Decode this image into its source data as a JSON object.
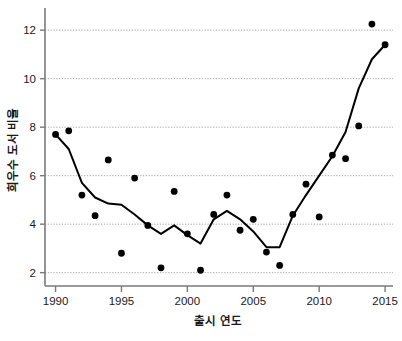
{
  "chart_data": {
    "type": "scatter",
    "title": "",
    "subtitle": "",
    "xlabel": "출시 연도",
    "ylabel": "희우수 도서 비율",
    "xlim": [
      1989.2,
      2015.6
    ],
    "ylim": [
      1.45,
      12.75
    ],
    "xticks": [
      1990,
      1995,
      2000,
      2005,
      2010,
      2015
    ],
    "xtick_labels": [
      "1990",
      "1995",
      "2000",
      "2005",
      "2010",
      "2015"
    ],
    "yticks": [
      2,
      4,
      6,
      8,
      10,
      12
    ],
    "ytick_labels": [
      "2",
      "4",
      "6",
      "8",
      "10",
      "12"
    ],
    "grid": "horizontal-dotted",
    "grid_color": "#8a8a8a",
    "legend": "none",
    "marker_color": "#000000",
    "line_color": "#000000",
    "axis_color": "#7a7a7a",
    "x": [
      1990,
      1991,
      1992,
      1993,
      1994,
      1995,
      1996,
      1997,
      1998,
      1999,
      2000,
      2001,
      2002,
      2003,
      2004,
      2005,
      2006,
      2007,
      2008,
      2009,
      2010,
      2011,
      2012,
      2013,
      2014,
      2015
    ],
    "series": [
      {
        "name": "scatter-points",
        "render": "markers",
        "values": [
          7.7,
          7.85,
          5.2,
          4.35,
          6.65,
          2.8,
          5.9,
          3.95,
          2.2,
          5.35,
          3.6,
          2.1,
          4.4,
          5.2,
          3.75,
          4.2,
          2.85,
          2.3,
          4.4,
          5.65,
          4.3,
          6.85,
          6.7,
          8.05,
          12.25,
          11.4
        ]
      },
      {
        "name": "trend-line",
        "render": "line",
        "values": [
          7.7,
          7.1,
          5.7,
          5.1,
          4.85,
          4.8,
          4.4,
          3.95,
          3.6,
          3.95,
          3.55,
          3.2,
          4.2,
          4.55,
          4.2,
          3.7,
          3.05,
          3.05,
          4.35,
          5.2,
          6.0,
          6.8,
          7.8,
          9.6,
          10.8,
          11.4
        ]
      }
    ]
  },
  "axes": {
    "x_title": "출시 연도",
    "y_title": "희우수 도서 비율"
  }
}
